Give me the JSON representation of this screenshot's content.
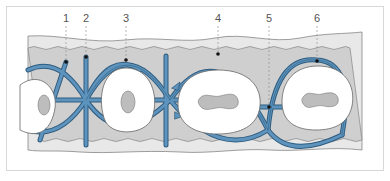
{
  "diagram": {
    "type": "periodontal-fiber-cross-section",
    "labels": [
      {
        "id": "1",
        "text": "1",
        "x": 66
      },
      {
        "id": "2",
        "text": "2",
        "x": 86
      },
      {
        "id": "3",
        "text": "3",
        "x": 126
      },
      {
        "id": "4",
        "text": "4",
        "x": 218
      },
      {
        "id": "5",
        "text": "5",
        "x": 269
      },
      {
        "id": "6",
        "text": "6",
        "x": 317
      }
    ],
    "colors": {
      "gingiva_outer": "#e6e6e6",
      "gingiva_inner": "#cfcfcf",
      "fiber_blue": "#4a7fa8",
      "fiber_dark": "#2f5d80",
      "tooth": "#ffffff",
      "pulp": "#bdbdbd",
      "outline": "#666666"
    }
  }
}
